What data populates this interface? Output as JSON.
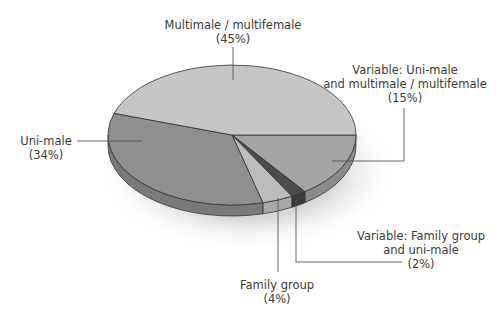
{
  "chart_data": {
    "type": "pie",
    "title": "",
    "style": "3d-perspective",
    "slices": [
      {
        "key": "var15",
        "label": "Variable: Uni-male and multimale/multifemale",
        "value": 15,
        "color": "#a4a4a4",
        "side_color": "#8a8a8a"
      },
      {
        "key": "var2",
        "label": "Variable: Family group and uni-male",
        "value": 2,
        "color": "#4c4c4c",
        "side_color": "#3c3c3c"
      },
      {
        "key": "family",
        "label": "Family group",
        "value": 4,
        "color": "#bcbcbc",
        "side_color": "#a8a8a8"
      },
      {
        "key": "uni",
        "label": "Uni-male",
        "value": 34,
        "color": "#8f8f8f",
        "side_color": "#7a7a7a"
      },
      {
        "key": "multi",
        "label": "Multimale/multifemale",
        "value": 45,
        "color": "#c5c5c5",
        "side_color": "#aaaaaa"
      }
    ],
    "legend": "none (callout labels)"
  },
  "labels": {
    "multi": {
      "line1": "Multimale / multifemale",
      "line2": "(45%)"
    },
    "var15": {
      "line1": "Variable: Uni-male",
      "line2": "and multimale / multifemale",
      "line3": "(15%)"
    },
    "uni": {
      "line1": "Uni-male",
      "line2": "(34%)"
    },
    "var2": {
      "line1": "Variable: Family group",
      "line2": "and uni-male",
      "line3": "(2%)"
    },
    "family": {
      "line1": "Family group",
      "line2": "(4%)"
    }
  }
}
